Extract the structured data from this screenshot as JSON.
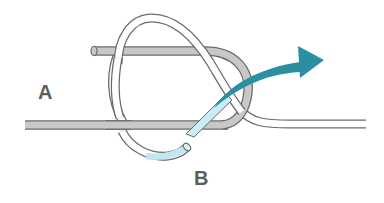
{
  "diagram": {
    "type": "knot-tying-illustration",
    "labels": {
      "a": "A",
      "b": "B"
    },
    "colors": {
      "rope_gray_fill": "#c8c8c8",
      "rope_outline": "#6a6a6a",
      "rope_white_fill": "#ffffff",
      "rope_end_highlight": "#bfe8f0",
      "arrow": "#2a8fa0",
      "label_text": "#5e5e5e",
      "background": "#ffffff"
    },
    "elements": [
      {
        "id": "rope-a-standing-part",
        "color": "gray",
        "description": "Horizontal gray rope entering from the left"
      },
      {
        "id": "rope-a-bight",
        "color": "gray",
        "description": "Gray bight folded back forming an upper parallel strand and a loop on the right"
      },
      {
        "id": "rope-b-loop",
        "color": "white",
        "description": "White rope forming an oval loop around both gray strands"
      },
      {
        "id": "rope-b-working-end",
        "color": "light-blue",
        "description": "Highlighted working end of rope B"
      },
      {
        "id": "rope-b-standing-part",
        "color": "white",
        "description": "White rope exiting to the right"
      },
      {
        "id": "direction-arrow",
        "color": "teal",
        "description": "Curved arrow showing the working end being pulled through the gray loop toward the upper right"
      }
    ]
  }
}
